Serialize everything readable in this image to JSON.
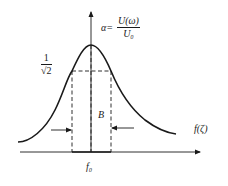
{
  "diagram": {
    "type": "resonance-curve",
    "colors": {
      "stroke": "#1a1a1a",
      "background": "#ffffff"
    },
    "y_axis": {
      "label_lhs": "α=",
      "label_numerator": "U(ω)",
      "label_denominator": "U₀"
    },
    "x_axis": {
      "label": "f(ζ)"
    },
    "half_power_level": {
      "numerator": "1",
      "denominator": "√2"
    },
    "bandwidth_label": "B",
    "center_frequency_label": "f₀"
  }
}
